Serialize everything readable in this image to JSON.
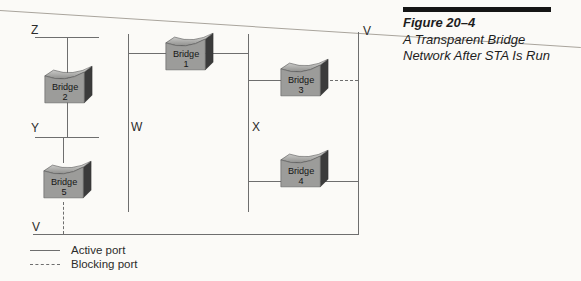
{
  "figure_caption": {
    "number": "Figure 20–4",
    "title_line1": "A Transparent Bridge",
    "title_line2": "Network After STA Is Run"
  },
  "diagram": {
    "lan_labels": {
      "z": "Z",
      "y": "Y",
      "w": "W",
      "x": "X",
      "v_top": "V",
      "v_bottom": "V"
    },
    "bridges": [
      {
        "name": "Bridge",
        "number": "1"
      },
      {
        "name": "Bridge",
        "number": "2"
      },
      {
        "name": "Bridge",
        "number": "3"
      },
      {
        "name": "Bridge",
        "number": "4"
      },
      {
        "name": "Bridge",
        "number": "5"
      }
    ],
    "legend": [
      {
        "style": "solid",
        "label": "Active port"
      },
      {
        "style": "dashed",
        "label": "Blocking port"
      }
    ],
    "colors": {
      "line": "#6e6e6e",
      "bridge_front": "#9c9c9a",
      "bridge_side": "#3b3b3b",
      "label_text": "#2b2b2b",
      "caption_bar": "#151515"
    }
  }
}
